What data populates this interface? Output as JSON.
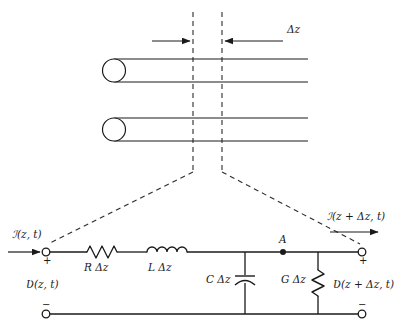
{
  "figure": {
    "stroke_color": "#1a1a1a",
    "dash_color": "#2b2b2b",
    "background": "#ffffff"
  },
  "upper": {
    "delta_z_label": "Δz",
    "conductor_count": 2,
    "dashed_marker_left_label": "",
    "dashed_marker_right_label": ""
  },
  "circuit": {
    "current_in": "ℐ(z, t)",
    "current_out": "ℐ(z + Δz, t)",
    "voltage_in": "Ʋ(z, t)",
    "voltage_out": "Ʋ(z + Δz, t)",
    "series_resistor": "R Δz",
    "series_inductor": "L Δz",
    "shunt_capacitor": "C Δz",
    "shunt_conductance": "G Δz",
    "node_label": "A",
    "plus_left": "+",
    "plus_right": "+",
    "minus_left": "−",
    "minus_right": "−"
  }
}
